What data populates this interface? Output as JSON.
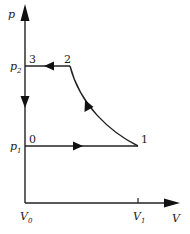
{
  "diagram": {
    "type": "p-V cycle",
    "axes": {
      "y_label": "p",
      "x_label": "V",
      "y_ticks": [
        {
          "main": "p",
          "sub": "2"
        },
        {
          "main": "p",
          "sub": "1"
        }
      ],
      "x_ticks": [
        {
          "main": "V",
          "sub": "0"
        },
        {
          "main": "V",
          "sub": "1"
        }
      ]
    },
    "points": [
      {
        "id": "0",
        "label": "0"
      },
      {
        "id": "1",
        "label": "1"
      },
      {
        "id": "2",
        "label": "2"
      },
      {
        "id": "3",
        "label": "3"
      }
    ],
    "paths": [
      {
        "from": "0",
        "to": "1",
        "kind": "isobaric at p1",
        "direction": "right"
      },
      {
        "from": "1",
        "to": "2",
        "kind": "curve",
        "direction": "up-left"
      },
      {
        "from": "2",
        "to": "3",
        "kind": "isobaric at p2",
        "direction": "left"
      },
      {
        "from": "3",
        "to": "V0 axis",
        "kind": "along p-axis",
        "direction": "down"
      }
    ],
    "colors": {
      "line": "#222222",
      "background": "#ffffff"
    }
  }
}
